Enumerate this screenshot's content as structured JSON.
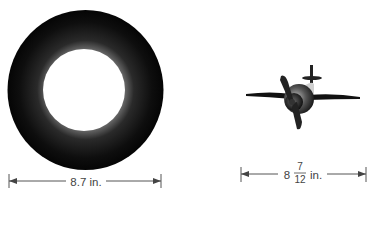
{
  "figures": [
    {
      "id": "ring",
      "description": "dark ring (record / tire shape) viewed from front",
      "dimension": {
        "whole": "8.7",
        "unit": "in.",
        "text": "8.7 in."
      }
    },
    {
      "id": "airplane",
      "description": "propeller airplane viewed from front",
      "dimension": {
        "whole": "8",
        "numerator": "7",
        "denominator": "12",
        "unit": "in.",
        "text": "8 7/12 in."
      }
    }
  ],
  "colors": {
    "ring_dark": "#111111",
    "ring_highlight": "#555555",
    "line": "#444444"
  }
}
